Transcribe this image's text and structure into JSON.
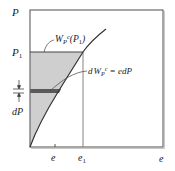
{
  "diagram": {
    "type": "complementary-work-area",
    "y_axis_label": "P",
    "x_axis_label": "e",
    "p1_label": "P",
    "p1_subscript": "1",
    "area_label_main": "W",
    "area_label_sub": "P",
    "area_label_sup": "c",
    "area_label_arg": "(P",
    "area_label_arg_sub": "1",
    "area_label_close": ")",
    "differential_label_prefix": "d",
    "differential_label_W": "W",
    "differential_label_sub": "P",
    "differential_label_sup": "c",
    "differential_label_rhs": " = edP",
    "dP_label": "dP",
    "e_tick_label": "e",
    "e1_label": "e",
    "e1_subscript": "1",
    "colors": {
      "frame": "#6b6b6b",
      "curve": "#333333",
      "shaded_area": "#cfcfcf",
      "strip": "#5a5a5a",
      "leader": "#444444"
    }
  }
}
